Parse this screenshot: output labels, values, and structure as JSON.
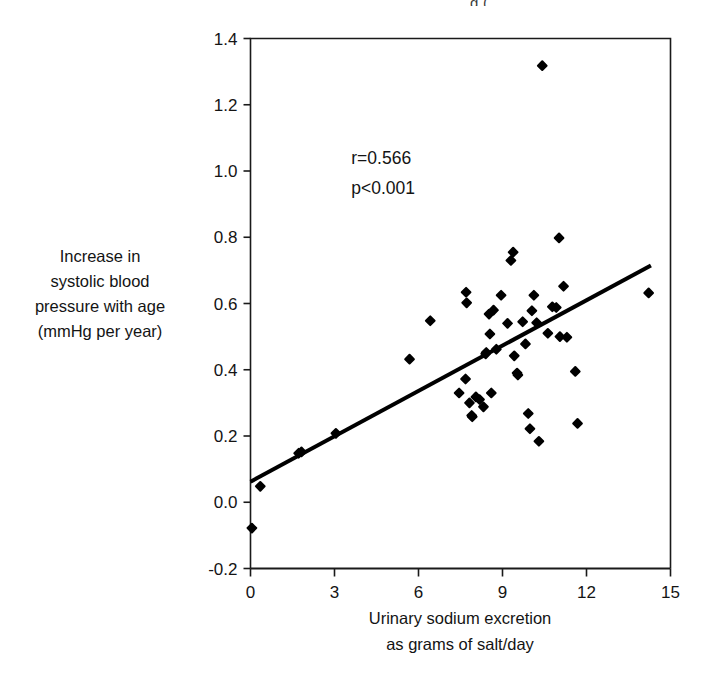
{
  "figure": {
    "top_fragment_text": "g (",
    "y_axis_title_lines": [
      "Increase in",
      "systolic blood",
      "pressure with age",
      "(mmHg per year)"
    ],
    "x_axis_title_lines": [
      "Urinary sodium excretion",
      "as grams of salt/day"
    ],
    "annotation_r": "r=0.566",
    "annotation_p": "p<0.001"
  },
  "chart_data": {
    "type": "scatter",
    "title": "",
    "xlabel": "Urinary sodium excretion as grams of salt/day",
    "ylabel": "Increase in systolic blood pressure with age (mmHg per year)",
    "xlim": [
      0,
      15
    ],
    "ylim": [
      -0.2,
      1.4
    ],
    "xticks": [
      0,
      3,
      6,
      9,
      12,
      15
    ],
    "yticks": [
      -0.2,
      0.0,
      0.2,
      0.4,
      0.6,
      0.8,
      1.0,
      1.2,
      1.4
    ],
    "xtick_labels": [
      "0",
      "3",
      "6",
      "9",
      "12",
      "15"
    ],
    "ytick_labels": [
      "-0.2",
      "0.0",
      "0.2",
      "0.4",
      "0.6",
      "0.8",
      "1.0",
      "1.2",
      "1.4"
    ],
    "grid": false,
    "legend": null,
    "marker": "filled-diamond",
    "marker_color": "#000000",
    "annotations": [
      {
        "text": "r=0.566",
        "x": 3.6,
        "y": 1.02
      },
      {
        "text": "p<0.001",
        "x": 3.6,
        "y": 0.93
      }
    ],
    "statistics": {
      "r": 0.566,
      "p": "<0.001"
    },
    "trendline": {
      "type": "linear",
      "x_start": 0.0,
      "y_start": 0.062,
      "x_end": 14.3,
      "y_end": 0.715,
      "color": "#000000",
      "width": 4
    },
    "points": [
      {
        "x": 0.05,
        "y": -0.078
      },
      {
        "x": 0.35,
        "y": 0.048
      },
      {
        "x": 1.72,
        "y": 0.148
      },
      {
        "x": 1.82,
        "y": 0.152
      },
      {
        "x": 3.05,
        "y": 0.208
      },
      {
        "x": 5.68,
        "y": 0.432
      },
      {
        "x": 6.42,
        "y": 0.548
      },
      {
        "x": 7.45,
        "y": 0.33
      },
      {
        "x": 7.68,
        "y": 0.372
      },
      {
        "x": 7.7,
        "y": 0.634
      },
      {
        "x": 7.72,
        "y": 0.602
      },
      {
        "x": 7.82,
        "y": 0.3
      },
      {
        "x": 7.9,
        "y": 0.262
      },
      {
        "x": 7.92,
        "y": 0.258
      },
      {
        "x": 8.05,
        "y": 0.318
      },
      {
        "x": 8.18,
        "y": 0.31
      },
      {
        "x": 8.32,
        "y": 0.288
      },
      {
        "x": 8.4,
        "y": 0.448
      },
      {
        "x": 8.42,
        "y": 0.452
      },
      {
        "x": 8.52,
        "y": 0.568
      },
      {
        "x": 8.55,
        "y": 0.508
      },
      {
        "x": 8.6,
        "y": 0.33
      },
      {
        "x": 8.68,
        "y": 0.58
      },
      {
        "x": 8.78,
        "y": 0.462
      },
      {
        "x": 8.95,
        "y": 0.625
      },
      {
        "x": 9.18,
        "y": 0.54
      },
      {
        "x": 9.3,
        "y": 0.73
      },
      {
        "x": 9.38,
        "y": 0.755
      },
      {
        "x": 9.42,
        "y": 0.442
      },
      {
        "x": 9.52,
        "y": 0.39
      },
      {
        "x": 9.55,
        "y": 0.384
      },
      {
        "x": 9.72,
        "y": 0.545
      },
      {
        "x": 9.82,
        "y": 0.478
      },
      {
        "x": 9.92,
        "y": 0.268
      },
      {
        "x": 9.98,
        "y": 0.222
      },
      {
        "x": 10.05,
        "y": 0.578
      },
      {
        "x": 10.12,
        "y": 0.625
      },
      {
        "x": 10.22,
        "y": 0.542
      },
      {
        "x": 10.3,
        "y": 0.184
      },
      {
        "x": 10.42,
        "y": 1.318
      },
      {
        "x": 10.62,
        "y": 0.51
      },
      {
        "x": 10.78,
        "y": 0.59
      },
      {
        "x": 10.92,
        "y": 0.588
      },
      {
        "x": 11.02,
        "y": 0.798
      },
      {
        "x": 11.05,
        "y": 0.5
      },
      {
        "x": 11.18,
        "y": 0.652
      },
      {
        "x": 11.3,
        "y": 0.498
      },
      {
        "x": 11.6,
        "y": 0.395
      },
      {
        "x": 11.68,
        "y": 0.238
      },
      {
        "x": 14.22,
        "y": 0.632
      }
    ]
  }
}
